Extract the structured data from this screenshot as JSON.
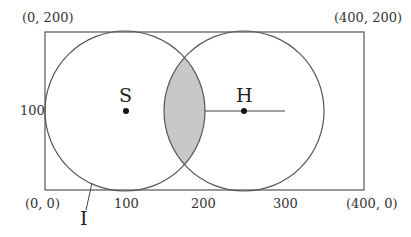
{
  "diagram": {
    "corners": {
      "top_left": "(0, 200)",
      "top_right": "(400, 200)",
      "bottom_left": "(0, 0)",
      "bottom_right": "(400, 0)"
    },
    "axis_labels": {
      "y_mid": "100",
      "x_100": "100",
      "x_200": "200",
      "x_300": "300"
    },
    "points": {
      "S": "S",
      "H": "H"
    },
    "pointer_label": "I",
    "colors": {
      "stroke": "#555555",
      "shade": "#c8c8c8",
      "point": "#111111"
    }
  }
}
